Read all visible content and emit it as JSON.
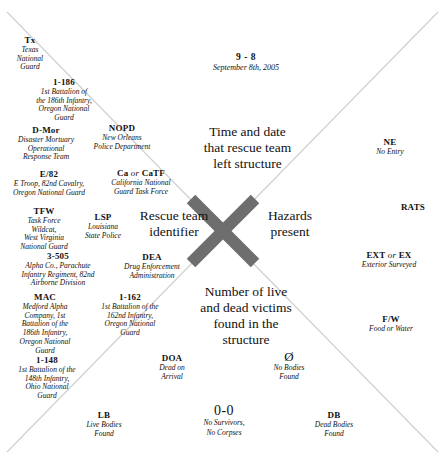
{
  "diagram": {
    "line_color": "#cfcfcf",
    "x_color": "#6e6e6e",
    "background": "#ffffff"
  },
  "date_top": {
    "code": "9 - 8",
    "meaning": "September 8th, 2005"
  },
  "captions": {
    "top": "Time and date\nthat rescue team\nleft structure",
    "top_line1": "Time and date",
    "top_line2": "that rescue team",
    "top_line3": "left structure",
    "left_line1": "Rescue team",
    "left_line2": "identifier",
    "right_line1": "Hazards",
    "right_line2": "present",
    "bottom_line1": "Number of live",
    "bottom_line2": "and dead victims",
    "bottom_line3": "found in the",
    "bottom_line4": "structure"
  },
  "team_identifiers": [
    {
      "abbr": "Tx",
      "desc": [
        "Texas",
        "National",
        "Guard"
      ]
    },
    {
      "abbr": "1-186",
      "desc": [
        "1st Battalion of",
        "the 186th Infantry,",
        "Oregon National",
        "Guard"
      ]
    },
    {
      "abbr": "D-Mor",
      "desc": [
        "Disaster Mortuary",
        "Operational",
        "Response Team"
      ]
    },
    {
      "abbr": "NOPD",
      "desc": [
        "New Orleans",
        "Police Department"
      ]
    },
    {
      "abbr": "E/82",
      "desc": [
        "E Troop, 82nd Cavalry,",
        "Oregon National Guard"
      ]
    },
    {
      "abbr_parts": [
        "Ca",
        "or",
        "CaTF"
      ],
      "abbr": "Ca or CaTF",
      "desc": [
        "California National",
        "Guard Task Force"
      ]
    },
    {
      "abbr": "TFW",
      "desc": [
        "Task Force",
        "Wildcat,",
        "West Virginia",
        "National Guard"
      ]
    },
    {
      "abbr": "LSP",
      "desc": [
        "Louisiana",
        "State Police"
      ]
    },
    {
      "abbr": "3-505",
      "desc": [
        "Alpha Co., Parachute",
        "Infantry Regiment, 82nd",
        "Airborne Division"
      ]
    },
    {
      "abbr": "DEA",
      "desc": [
        "Drug Enforcement",
        "Administration"
      ]
    },
    {
      "abbr": "MAC",
      "desc": [
        "Medford Alpha",
        "Company, 1st",
        "Battalion of the",
        "186th Infantry,",
        "Oregon National",
        "Guard"
      ]
    },
    {
      "abbr": "1-162",
      "desc": [
        "1st Battalion of the",
        "162nd Infantry,",
        "Oregon National",
        "Guard"
      ]
    },
    {
      "abbr": "1-148",
      "desc": [
        "1st Battalion of the",
        "148th Infantry,",
        "Ohio National",
        "Guard"
      ]
    }
  ],
  "hazards": [
    {
      "abbr": "NE",
      "desc": [
        "No Entry"
      ]
    },
    {
      "abbr": "RATS",
      "desc": []
    },
    {
      "abbr_parts": [
        "EXT",
        "or",
        "EX"
      ],
      "abbr": "EXT or EX",
      "desc": [
        "Exterior Surveyed"
      ]
    },
    {
      "abbr": "F/W",
      "desc": [
        "Food or Water"
      ]
    }
  ],
  "victims": [
    {
      "abbr": "DOA",
      "desc": [
        "Dead on",
        "Arrival"
      ]
    },
    {
      "abbr": "Ø",
      "desc": [
        "No Bodies",
        "Found"
      ]
    },
    {
      "abbr": "LB",
      "desc": [
        "Live Bodies",
        "Found"
      ]
    },
    {
      "abbr": "0-0",
      "desc": [
        "No Survivors,",
        "No Corpses"
      ]
    },
    {
      "abbr": "DB",
      "desc": [
        "Dead Bodies",
        "Found"
      ]
    }
  ]
}
